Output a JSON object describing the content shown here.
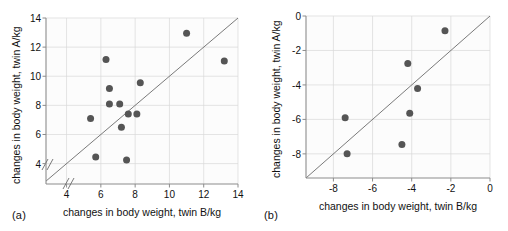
{
  "figure": {
    "marker_color": "#555555",
    "grid_color": "#d9d9d9",
    "axis_color": "#8c8c8c",
    "line_color": "#6b6b6b"
  },
  "panels": [
    {
      "label": "(a)",
      "xlabel": "changes in body weight, twin B/kg",
      "ylabel": "changes in body weight, twin A/kg",
      "xticks": [
        "4",
        "6",
        "8",
        "10",
        "12",
        "14"
      ],
      "yticks": [
        "4",
        "6",
        "8",
        "10",
        "12",
        "14"
      ],
      "axis_break": true
    },
    {
      "label": "(b)",
      "xlabel": "changes in body weight, twin B/kg",
      "ylabel": "changes in body weight, twin A/kg",
      "xticks": [
        "-8",
        "-6",
        "-4",
        "-2",
        "0"
      ],
      "yticks": [
        "-8",
        "-6",
        "-4",
        "-2",
        "0"
      ],
      "axis_break": false
    }
  ],
  "chart_data": [
    {
      "type": "scatter",
      "panel": "(a)",
      "title": "",
      "xlabel": "changes in body weight, twin B/kg",
      "ylabel": "changes in body weight, twin A/kg",
      "xlim": [
        2.8,
        14
      ],
      "ylim": [
        2.6,
        14
      ],
      "xticks": [
        4,
        6,
        8,
        10,
        12,
        14
      ],
      "yticks": [
        4,
        6,
        8,
        10,
        12,
        14
      ],
      "grid": true,
      "legend": "none",
      "axis_break_x": true,
      "axis_break_y": true,
      "reference_line": {
        "type": "identity",
        "label": "y = x",
        "from": [
          2.8,
          2.8
        ],
        "to": [
          14,
          14
        ]
      },
      "x": [
        5.4,
        5.7,
        6.3,
        6.5,
        6.5,
        7.1,
        7.2,
        7.5,
        7.6,
        8.1,
        8.3,
        11.0,
        13.2
      ],
      "y": [
        7.1,
        4.45,
        11.15,
        8.1,
        9.15,
        8.1,
        6.5,
        4.25,
        7.4,
        7.4,
        9.55,
        12.95,
        11.05
      ],
      "points": [
        {
          "x": 5.4,
          "y": 7.1
        },
        {
          "x": 5.7,
          "y": 4.45
        },
        {
          "x": 6.3,
          "y": 11.15
        },
        {
          "x": 6.5,
          "y": 9.15
        },
        {
          "x": 6.5,
          "y": 8.1
        },
        {
          "x": 7.1,
          "y": 8.1
        },
        {
          "x": 7.2,
          "y": 6.5
        },
        {
          "x": 7.5,
          "y": 4.25
        },
        {
          "x": 7.6,
          "y": 7.4
        },
        {
          "x": 8.1,
          "y": 7.4
        },
        {
          "x": 8.3,
          "y": 9.55
        },
        {
          "x": 11.0,
          "y": 12.95
        },
        {
          "x": 13.2,
          "y": 11.05
        }
      ]
    },
    {
      "type": "scatter",
      "panel": "(b)",
      "title": "",
      "xlabel": "changes in body weight, twin B/kg",
      "ylabel": "changes in body weight, twin A/kg",
      "xlim": [
        -9.4,
        0
      ],
      "ylim": [
        -9.4,
        0
      ],
      "xticks": [
        -8,
        -6,
        -4,
        -2,
        0
      ],
      "yticks": [
        -8,
        -6,
        -4,
        -2,
        0
      ],
      "grid": true,
      "legend": "none",
      "axis_break_x": false,
      "axis_break_y": false,
      "reference_line": {
        "type": "identity",
        "label": "y = x",
        "from": [
          -9.4,
          -9.4
        ],
        "to": [
          0,
          0
        ]
      },
      "x": [
        -7.4,
        -7.3,
        -4.5,
        -4.2,
        -4.1,
        -3.7,
        -2.3
      ],
      "y": [
        -5.9,
        -8.0,
        -7.45,
        -2.75,
        -5.65,
        -4.2,
        -0.85
      ],
      "points": [
        {
          "x": -7.4,
          "y": -5.9
        },
        {
          "x": -7.3,
          "y": -8.0
        },
        {
          "x": -4.5,
          "y": -7.45
        },
        {
          "x": -4.2,
          "y": -2.75
        },
        {
          "x": -4.1,
          "y": -5.65
        },
        {
          "x": -3.7,
          "y": -4.2
        },
        {
          "x": -2.3,
          "y": -0.85
        }
      ]
    }
  ]
}
